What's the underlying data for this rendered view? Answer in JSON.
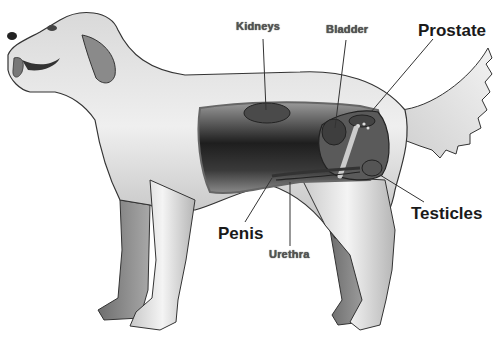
{
  "diagram": {
    "labels": [
      {
        "id": "kidneys",
        "text": "Kidneys",
        "size": "small",
        "x": 236,
        "y": 21,
        "line": [
          263,
          39,
          266,
          118
        ]
      },
      {
        "id": "bladder",
        "text": "Bladder",
        "size": "small",
        "x": 326,
        "y": 24,
        "line": [
          346,
          40,
          335,
          128
        ]
      },
      {
        "id": "prostate",
        "text": "Prostate",
        "size": "big",
        "x": 418,
        "y": 22,
        "line": [
          433,
          39,
          371,
          112
        ]
      },
      {
        "id": "testicles",
        "text": "Testicles",
        "size": "big",
        "x": 411,
        "y": 205,
        "line": [
          424,
          202,
          380,
          175
        ]
      },
      {
        "id": "penis",
        "text": "Penis",
        "size": "big",
        "x": 218,
        "y": 225,
        "line": [
          245,
          222,
          272,
          176
        ]
      },
      {
        "id": "urethra",
        "text": "Urethra",
        "size": "small",
        "x": 269,
        "y": 249,
        "line": [
          290,
          246,
          290,
          182
        ]
      }
    ],
    "colors": {
      "outline": "#333333",
      "fur_light": "#e9e9e9",
      "fur_mid": "#bdbdbd",
      "fur_dark": "#7a7a7a",
      "cavity": "#2a2a2a",
      "organ": "#555555",
      "leader_line": "#333333"
    }
  }
}
